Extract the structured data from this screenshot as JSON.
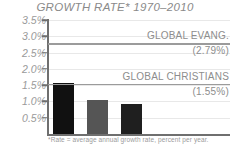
{
  "chart_data": {
    "type": "bar",
    "title": "GROWTH RATE* 1970–2010",
    "xlabel": "",
    "ylabel": "",
    "ylim": [
      0.0,
      3.5
    ],
    "grid": true,
    "legend_position": "none",
    "categories": [
      "",
      "",
      ""
    ],
    "values": [
      1.58,
      1.05,
      0.93
    ],
    "bar_colors": [
      "#111111",
      "#555555",
      "#1f1f1f"
    ],
    "yticks": [
      3.5,
      3.0,
      2.5,
      2.0,
      1.5,
      1.0,
      0.5
    ],
    "ytick_labels": [
      "3.5%",
      "3.0%",
      "2.5%",
      "2.0%",
      "1.5%",
      "1.0%",
      "0.5%"
    ],
    "reference_lines": [
      {
        "label": "GLOBAL EVANG.",
        "value_label": "(2.79%)",
        "value": 2.79,
        "color": "#9b9b9b"
      },
      {
        "label": "GLOBAL CHRISTIANS",
        "value_label": "(1.55%)",
        "value": 1.55,
        "color": "#9b9b9b"
      }
    ],
    "footnote": "*Rate = average annual growth rate, percent per year.",
    "annotations": []
  },
  "colors": {
    "axis": "#6f6f6f",
    "grid": "#e8e8e8",
    "text_muted": "#9a9a9a",
    "text_label": "#8d8d8d",
    "title": "#8a8a8a",
    "background": "#ffffff"
  }
}
